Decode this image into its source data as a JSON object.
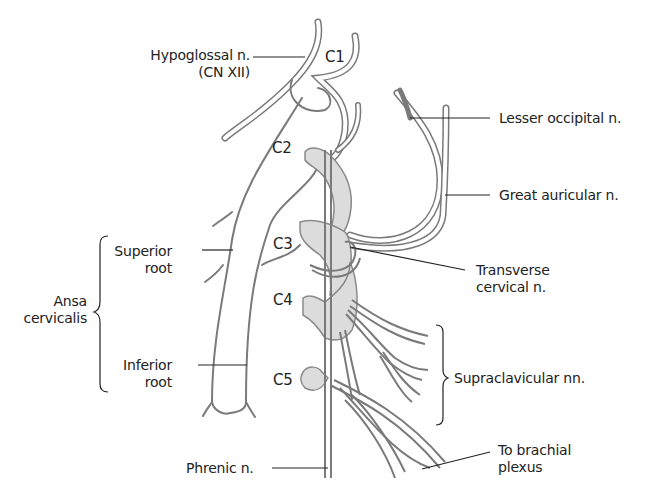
{
  "figure": {
    "colors": {
      "nerve_outline": "#7a7a7a",
      "nerve_fill": "#ffffff",
      "root_fill": "#dcdcdc",
      "leader_line": "#222222",
      "text": "#222222",
      "background": "#ffffff"
    }
  },
  "segments": {
    "c1": "C1",
    "c2": "C2",
    "c3": "C3",
    "c4": "C4",
    "c5": "C5"
  },
  "labels": {
    "hypoglossal_line1": "Hypoglossal n.",
    "hypoglossal_line2": "(CN XII)",
    "lesser_occipital": "Lesser occipital n.",
    "great_auricular": "Great auricular n.",
    "superior_root_line1": "Superior",
    "superior_root_line2": "root",
    "ansa_line1": "Ansa",
    "ansa_line2": "cervicalis",
    "transverse_line1": "Transverse",
    "transverse_line2": "cervical n.",
    "inferior_root_line1": "Inferior",
    "inferior_root_line2": "root",
    "supraclavicular": "Supraclavicular nn.",
    "phrenic": "Phrenic n.",
    "brachial_line1": "To brachial",
    "brachial_line2": "plexus"
  }
}
